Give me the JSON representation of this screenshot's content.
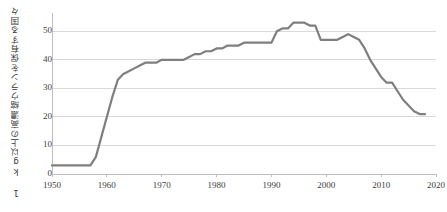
{
  "chart_data": {
    "type": "line",
    "title": "",
    "xlabel": "",
    "ylabel": "1 kg以上の高濃縮ウランを保有する国々",
    "xlim": [
      1950,
      2020
    ],
    "ylim": [
      0,
      55
    ],
    "yticks": [
      0,
      10,
      20,
      30,
      40,
      50
    ],
    "xticks": [
      1950,
      1960,
      1970,
      1980,
      1990,
      2000,
      2010,
      2020
    ],
    "ytick_labels": [
      "0",
      "10",
      "20",
      "30",
      "40",
      "50"
    ],
    "xtick_labels": [
      "1950",
      "1960",
      "1970",
      "1980",
      "1990",
      "2000",
      "2010",
      "2020"
    ],
    "grid": "horizontal",
    "legend": "none",
    "line_color": "#7f7f7f",
    "line_width": 2.2,
    "series": [
      {
        "name": "1 kg以上の高濃縮ウランを保有する国々",
        "x": [
          1950,
          1951,
          1952,
          1953,
          1954,
          1955,
          1956,
          1957,
          1958,
          1959,
          1960,
          1961,
          1962,
          1963,
          1964,
          1965,
          1966,
          1967,
          1968,
          1969,
          1970,
          1971,
          1972,
          1973,
          1974,
          1975,
          1976,
          1977,
          1978,
          1979,
          1980,
          1981,
          1982,
          1983,
          1984,
          1985,
          1986,
          1987,
          1988,
          1989,
          1990,
          1991,
          1992,
          1993,
          1994,
          1995,
          1996,
          1997,
          1998,
          1999,
          2000,
          2001,
          2002,
          2003,
          2004,
          2005,
          2006,
          2007,
          2008,
          2009,
          2010,
          2011,
          2012,
          2013,
          2014,
          2015,
          2016,
          2017,
          2018
        ],
        "y": [
          3,
          3,
          3,
          3,
          3,
          3,
          3,
          3,
          6,
          13,
          20,
          27,
          33,
          35,
          36,
          37,
          38,
          39,
          39,
          39,
          40,
          40,
          40,
          40,
          40,
          41,
          42,
          42,
          43,
          43,
          44,
          44,
          45,
          45,
          45,
          46,
          46,
          46,
          46,
          46,
          46,
          50,
          51,
          51,
          53,
          53,
          53,
          52,
          52,
          47,
          47,
          47,
          47,
          48,
          49,
          48,
          47,
          44,
          40,
          37,
          34,
          32,
          32,
          29,
          26,
          24,
          22,
          21,
          21
        ]
      }
    ]
  }
}
